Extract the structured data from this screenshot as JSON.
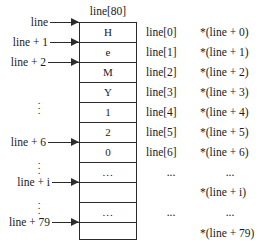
{
  "figure": {
    "title": "line[80]",
    "array": {
      "name": "line[80]",
      "declared_size": 80,
      "cells": [
        {
          "value": "H",
          "index": 0,
          "kind": "char"
        },
        {
          "value": "e",
          "index": 1,
          "kind": "char"
        },
        {
          "value": "M",
          "index": 2,
          "kind": "char"
        },
        {
          "value": "Y",
          "index": 3,
          "kind": "char"
        },
        {
          "value": "1",
          "index": 4,
          "kind": "char"
        },
        {
          "value": "2",
          "index": 5,
          "kind": "char"
        },
        {
          "value": "0",
          "index": 6,
          "kind": "char"
        },
        {
          "value": "...",
          "index": null,
          "kind": "ellipsis"
        },
        {
          "value": "",
          "index": null,
          "kind": "blank"
        },
        {
          "value": "...",
          "index": null,
          "kind": "ellipsis"
        },
        {
          "value": "",
          "index": null,
          "kind": "blank"
        }
      ]
    },
    "pointer_labels": [
      {
        "text": "line",
        "target_boundary": 0
      },
      {
        "text": "line + 1",
        "target_boundary": 1
      },
      {
        "text": "line + 2",
        "target_boundary": 2
      },
      {
        "text": "line + 6",
        "target_boundary": 6
      },
      {
        "text": "line + i",
        "target_boundary": 9
      },
      {
        "text": "line + 79",
        "target_boundary": 11
      }
    ],
    "left_ellipses": [
      {
        "symbol": "⋮"
      },
      {
        "symbol": "⋮"
      },
      {
        "symbol": "⋮"
      }
    ],
    "index_column": [
      "line[0]",
      "line[1]",
      "line[2]",
      "line[3]",
      "line[4]",
      "line[5]",
      "line[6]",
      "...",
      "...",
      "..."
    ],
    "deref_column": [
      "*(line + 0)",
      "*(line + 1)",
      "*(line + 2)",
      "*(line + 3)",
      "*(line + 4)",
      "*(line + 5)",
      "*(line + 6)",
      "...",
      "*(line + i)",
      "...",
      "*(line + 79)"
    ],
    "colors": {
      "background": "#ffffff",
      "stroke": "#2b2b2b",
      "text": "#1a1a1a"
    }
  }
}
